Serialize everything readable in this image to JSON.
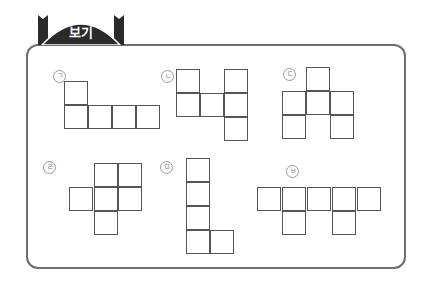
{
  "header": {
    "tab_label": "보기",
    "tab_color": "#2b2b2b",
    "frame_color": "#6e6e6e"
  },
  "shapes": [
    {
      "label": "ㄱ",
      "label_pos": [
        53,
        70
      ],
      "cells": [
        [
          64,
          81
        ],
        [
          64,
          105
        ],
        [
          88,
          105
        ],
        [
          112,
          105
        ],
        [
          136,
          105
        ]
      ]
    },
    {
      "label": "ㄴ",
      "label_pos": [
        161,
        70
      ],
      "cells": [
        [
          176,
          69
        ],
        [
          176,
          93
        ],
        [
          200,
          93
        ],
        [
          224,
          69
        ],
        [
          224,
          93
        ],
        [
          224,
          117
        ]
      ]
    },
    {
      "label": "ㄷ",
      "label_pos": [
        283,
        68
      ],
      "cells": [
        [
          306,
          67
        ],
        [
          282,
          91
        ],
        [
          306,
          91
        ],
        [
          330,
          91
        ],
        [
          282,
          115
        ],
        [
          330,
          115
        ]
      ]
    },
    {
      "label": "ㄹ",
      "label_pos": [
        43,
        161
      ],
      "cells": [
        [
          94,
          163
        ],
        [
          118,
          163
        ],
        [
          69,
          187
        ],
        [
          94,
          187
        ],
        [
          118,
          187
        ],
        [
          94,
          211
        ]
      ]
    },
    {
      "label": "ㅁ",
      "label_pos": [
        160,
        161
      ],
      "cells": [
        [
          186,
          158
        ],
        [
          186,
          182
        ],
        [
          186,
          206
        ],
        [
          186,
          230
        ],
        [
          210,
          230
        ]
      ]
    },
    {
      "label": "ㅂ",
      "label_pos": [
        286,
        165
      ],
      "cells": [
        [
          257,
          187
        ],
        [
          282,
          187
        ],
        [
          307,
          187
        ],
        [
          332,
          187
        ],
        [
          357,
          187
        ],
        [
          282,
          211
        ],
        [
          332,
          211
        ]
      ]
    }
  ]
}
